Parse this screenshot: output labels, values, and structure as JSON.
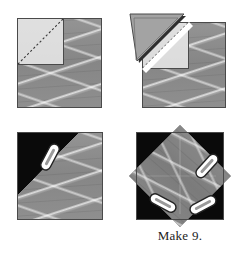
{
  "document": {
    "type": "quilting-instruction-diagram",
    "caption": "Make 9.",
    "background_color": "#ffffff"
  },
  "colors": {
    "fabric_gray": "#8b8b8b",
    "fabric_light_gray": "#a3a3a3",
    "background_black": "#0a0a0a",
    "outline": "#4a4a4a",
    "pin_white": "#ffffff",
    "pin_outline": "#2a2a2a",
    "stitch_dash": "#3a3a3a",
    "caption_text": "#1c1c1c",
    "page_white": "#ffffff"
  },
  "panels": [
    {
      "id": "panel-1",
      "step": 1,
      "label": "background square with corner square marked on the diagonal",
      "shapes": [
        {
          "name": "background-square",
          "fill": "fabric_gray"
        },
        {
          "name": "corner-square",
          "fill": "fabric_light_gray",
          "position": "top-left"
        },
        {
          "name": "stitch-line",
          "style": "dashed",
          "direction": "top-right-to-bottom-left"
        }
      ]
    },
    {
      "id": "panel-2",
      "step": 2,
      "label": "corner triangle folded open along the stitched diagonal",
      "shapes": [
        {
          "name": "background-square",
          "fill": "fabric_gray"
        },
        {
          "name": "corner-square",
          "fill": "fabric_light_gray",
          "position": "top-left"
        },
        {
          "name": "stitch-line",
          "style": "dashed",
          "direction": "top-right-to-bottom-left"
        },
        {
          "name": "folded-triangle",
          "fill": "fabric_light_gray",
          "position": "flipped-up-left"
        },
        {
          "name": "seam-allowance-strip",
          "fill": "page_white"
        }
      ]
    },
    {
      "id": "panel-3",
      "step": 3,
      "label": "trimmed unit pinned at one corner over black background",
      "shapes": [
        {
          "name": "background-square",
          "fill": "fabric_gray"
        },
        {
          "name": "black-corner-triangle",
          "fill": "background_black",
          "position": "top-left"
        },
        {
          "name": "pin",
          "count": 1
        }
      ]
    },
    {
      "id": "panel-4",
      "step": 4,
      "label": "finished on-point diamond unit pinned at three corners",
      "shapes": [
        {
          "name": "black-background-square",
          "fill": "background_black"
        },
        {
          "name": "fabric-diamond",
          "fill": "fabric_gray",
          "rotation_degrees": 45
        },
        {
          "name": "pin",
          "count": 3
        }
      ]
    }
  ],
  "pins": [
    {
      "panel": "panel-3",
      "name": "pin-upper-left",
      "angle_degrees": 118
    },
    {
      "panel": "panel-4",
      "name": "pin-right",
      "angle_degrees": 132
    },
    {
      "panel": "panel-4",
      "name": "pin-lower-left",
      "angle_degrees": 28
    },
    {
      "panel": "panel-4",
      "name": "pin-lower-right",
      "angle_degrees": 152
    }
  ]
}
